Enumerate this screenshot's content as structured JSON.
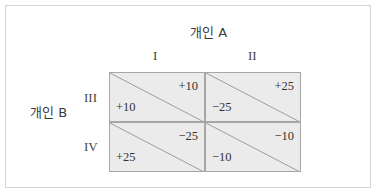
{
  "player_a": {
    "label": "개인 A",
    "strategies": [
      "I",
      "II"
    ]
  },
  "player_b": {
    "label": "개인 B",
    "strategies": [
      "III",
      "IV"
    ]
  },
  "matrix": [
    [
      {
        "a_payoff": "+10",
        "b_payoff": "+10"
      },
      {
        "a_payoff": "+25",
        "b_payoff": "−25"
      }
    ],
    [
      {
        "a_payoff": "−25",
        "b_payoff": "+25"
      },
      {
        "a_payoff": "−10",
        "b_payoff": "−10"
      }
    ]
  ],
  "colors": {
    "cell_fill": "#ebebeb",
    "grid_line": "#a6a6a6",
    "frame": "#d4d4d4"
  }
}
